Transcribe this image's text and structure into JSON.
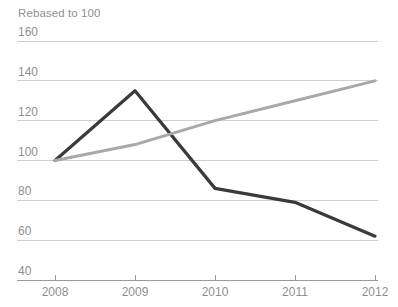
{
  "chart_data": {
    "type": "line",
    "title": "Rebased to 100",
    "xlabel": "",
    "ylabel": "",
    "x": [
      2008,
      2009,
      2010,
      2011,
      2012
    ],
    "categories": [
      "2008",
      "2009",
      "2010",
      "2011",
      "2012"
    ],
    "xtick_labels": [
      "2008",
      "2009",
      "2010",
      "2011",
      "2012"
    ],
    "ytick_labels": [
      "160",
      "140",
      "120",
      "100",
      "80",
      "60",
      "40"
    ],
    "yticks": [
      160,
      140,
      120,
      100,
      80,
      60,
      40
    ],
    "ylim": [
      40,
      160
    ],
    "xlim": [
      2008,
      2012
    ],
    "grid": true,
    "legend": "none",
    "series": [
      {
        "name": "dark-series",
        "color": "#3a3a3a",
        "values": [
          100,
          135,
          86,
          79,
          62
        ]
      },
      {
        "name": "gray-series",
        "color": "#a8a8a8",
        "values": [
          100,
          108,
          120,
          130,
          140
        ]
      }
    ],
    "colors": {
      "grid": "#cfcfcf",
      "axis": "#9a9a9a",
      "text": "#8f8f8f",
      "background": "#ffffff"
    }
  }
}
